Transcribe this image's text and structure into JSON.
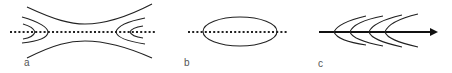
{
  "figure": {
    "panels": [
      {
        "id": "a",
        "label": "a",
        "description": "Flow lines converging toward a dotted axis, forming a narrow waist with nested curves at both ends"
      },
      {
        "id": "b",
        "label": "b",
        "description": "Ellipse centered on a dotted horizontal axis"
      },
      {
        "id": "c",
        "label": "c",
        "description": "Solid arrow to the right with four nested chevron-shaped curves opening rightward"
      }
    ],
    "colors": {
      "stroke": "#222222",
      "label": "#555555",
      "background": "#ffffff"
    }
  }
}
